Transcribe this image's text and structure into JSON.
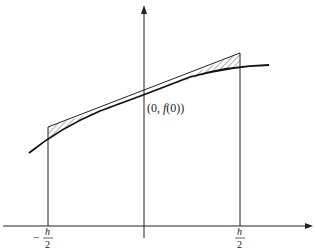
{
  "diagram": {
    "type": "midpoint-rule-illustration",
    "axes": {
      "x_axis": "horizontal axis with arrow",
      "y_axis": "vertical axis with arrow"
    },
    "point_label": "(0, f(0))",
    "point_label_parts": {
      "open": "(0, ",
      "func": "f",
      "close": "(0))"
    },
    "left_tick": {
      "sign": "−",
      "numerator": "h",
      "denominator": "2"
    },
    "right_tick": {
      "sign": "",
      "numerator": "h",
      "denominator": "2"
    },
    "colors": {
      "ink": "#222222",
      "background": "#ffffff"
    }
  }
}
